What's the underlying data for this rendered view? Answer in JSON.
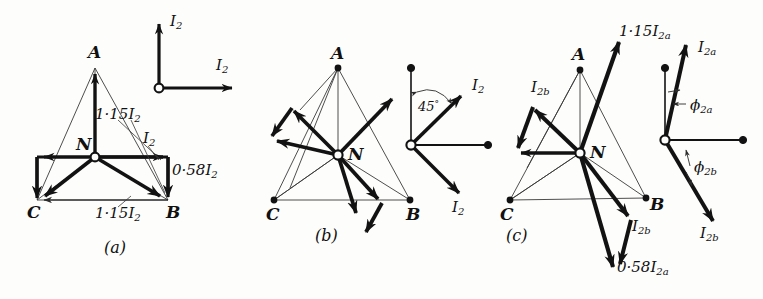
{
  "figure": {
    "background_color": "#fdfdfc",
    "ink_color": "#121212",
    "thin_line_color": "#3a3a3a"
  },
  "panels": [
    {
      "id": "a",
      "caption": "(a)",
      "nodes": [
        {
          "name": "A",
          "label": "A"
        },
        {
          "name": "B",
          "label": "B"
        },
        {
          "name": "C",
          "label": "C"
        },
        {
          "name": "N",
          "label": "N"
        }
      ],
      "annotations": [
        {
          "name": "mag-NA",
          "base": "1·15",
          "symbol": "I",
          "sub": "2",
          "text": "1·15 I2"
        },
        {
          "name": "mag-NB-horizontal",
          "base": "",
          "symbol": "I",
          "sub": "2",
          "text": "I2"
        },
        {
          "name": "mag-BC-right",
          "base": "0·58",
          "symbol": "I",
          "sub": "2",
          "text": "0·58 I2"
        },
        {
          "name": "mag-CB-bottom",
          "base": "1·15",
          "symbol": "I",
          "sub": "2",
          "text": "1·15 I2"
        }
      ],
      "key_diagram": {
        "name": "reference-phasor-key",
        "vectors": [
          {
            "name": "vertical-I2",
            "label": "I2",
            "base": "",
            "symbol": "I",
            "sub": "2",
            "direction": "up"
          },
          {
            "name": "horizontal-I2",
            "label": "I2",
            "base": "",
            "symbol": "I",
            "sub": "2",
            "direction": "right"
          }
        ]
      }
    },
    {
      "id": "b",
      "caption": "(b)",
      "nodes": [
        {
          "name": "A",
          "label": "A"
        },
        {
          "name": "B",
          "label": "B"
        },
        {
          "name": "C",
          "label": "C"
        },
        {
          "name": "N",
          "label": "N"
        }
      ],
      "annotations": [],
      "key_diagram": {
        "name": "reference-phasor-key",
        "angle_label": "45°",
        "angle_value": "45",
        "angle_unit": "°",
        "vectors": [
          {
            "name": "upper-I2",
            "label": "I2",
            "symbol": "I",
            "sub": "2",
            "direction": "up-right-45"
          },
          {
            "name": "lower-I2",
            "label": "I2",
            "symbol": "I",
            "sub": "2",
            "direction": "down-right-45"
          }
        ]
      }
    },
    {
      "id": "c",
      "caption": "(c)",
      "nodes": [
        {
          "name": "A",
          "label": "A"
        },
        {
          "name": "B",
          "label": "B"
        },
        {
          "name": "C",
          "label": "C"
        },
        {
          "name": "N",
          "label": "N"
        }
      ],
      "annotations": [
        {
          "name": "mag-NA-1p15",
          "base": "1·15",
          "symbol": "I",
          "sub": "2a",
          "text": "1·15 I2a"
        },
        {
          "name": "mag-upper-left-I2b",
          "base": "",
          "symbol": "I",
          "sub": "2b",
          "text": "I2b"
        },
        {
          "name": "mag-lower-right-I2b",
          "base": "",
          "symbol": "I",
          "sub": "2b",
          "text": "I2b"
        },
        {
          "name": "mag-bottom-0p58",
          "base": "0·58",
          "symbol": "I",
          "sub": "2a",
          "text": "0·58 I2a"
        }
      ],
      "key_diagram": {
        "name": "reference-phasor-key",
        "vectors": [
          {
            "name": "upper-I2a",
            "label": "I2a",
            "symbol": "I",
            "sub": "2a",
            "direction": "up-slightly-right"
          },
          {
            "name": "lower-I2b",
            "label": "I2b",
            "symbol": "I",
            "sub": "2b",
            "direction": "down-right"
          }
        ],
        "angles": [
          {
            "name": "phi-2a",
            "symbol": "ϕ",
            "sub": "2a",
            "text": "ϕ2a"
          },
          {
            "name": "phi-2b",
            "symbol": "ϕ",
            "sub": "2b",
            "text": "ϕ2b"
          }
        ]
      }
    }
  ]
}
